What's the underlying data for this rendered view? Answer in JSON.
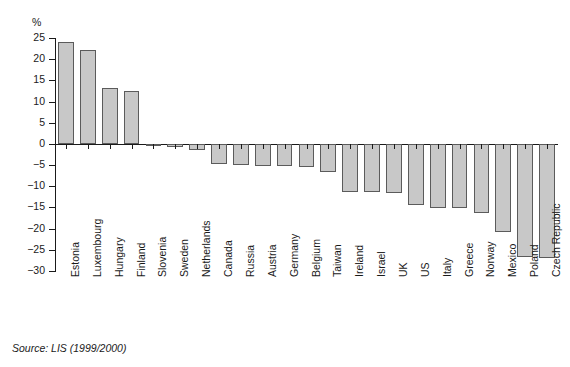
{
  "chart_data": {
    "type": "bar",
    "title": "",
    "subtitle": "",
    "xlabel": "",
    "ylabel": "%",
    "ylim": [
      -30,
      25
    ],
    "yticks": [
      25,
      20,
      15,
      10,
      5,
      0,
      -5,
      -10,
      -15,
      -20,
      -25,
      -30
    ],
    "ytick_labels": [
      "25",
      "20",
      "15",
      "10",
      "5",
      "0",
      "−5",
      "−10",
      "−15",
      "−20",
      "−25",
      "−30"
    ],
    "grid": false,
    "legend": null,
    "orientation": "vertical",
    "categories": [
      "Estonia",
      "Luxembourg",
      "Hungary",
      "Finland",
      "Slovenia",
      "Sweden",
      "Netherlands",
      "Canada",
      "Russia",
      "Austria",
      "Germany",
      "Belgium",
      "Taiwan",
      "Ireland",
      "Israel",
      "UK",
      "US",
      "Italy",
      "Greece",
      "Norway",
      "Mexico",
      "Poland",
      "Czech Republic"
    ],
    "values": [
      24.0,
      22.2,
      13.3,
      12.4,
      -0.4,
      -0.8,
      -1.4,
      -4.8,
      -5.0,
      -5.2,
      -5.3,
      -5.4,
      -6.6,
      -11.3,
      -11.4,
      -11.6,
      -14.5,
      -15.1,
      -15.2,
      -16.3,
      -20.8,
      -26.6,
      -26.9
    ],
    "series": [
      {
        "name": "value",
        "values": [
          24.0,
          22.2,
          13.3,
          12.4,
          -0.4,
          -0.8,
          -1.4,
          -4.8,
          -5.0,
          -5.2,
          -5.3,
          -5.4,
          -6.6,
          -11.3,
          -11.4,
          -11.6,
          -14.5,
          -15.1,
          -15.2,
          -16.3,
          -20.8,
          -26.6,
          -26.9
        ]
      }
    ],
    "bar_fill_color": "#c8c8c8",
    "bar_edge_color": "#5b5b5b",
    "axis_color": "#1a1a1a"
  },
  "source": {
    "text": "Source: LIS (1999/2000)"
  },
  "axis": {
    "unit_label": "%"
  }
}
